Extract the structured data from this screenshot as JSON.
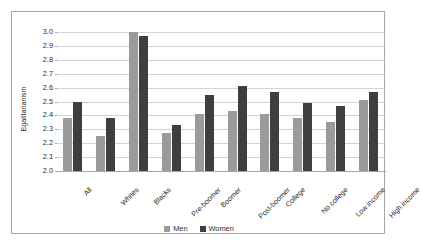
{
  "chart_data": {
    "type": "bar",
    "title": "",
    "xlabel": "",
    "ylabel": "Egalitarianism",
    "ylim": [
      2.0,
      3.0
    ],
    "ytick_step": 0.1,
    "yticks": [
      "3.0",
      "2.9",
      "2.8",
      "2.7",
      "2.6",
      "2.5",
      "2.4",
      "2.3",
      "2.2",
      "2.1",
      "2.0"
    ],
    "grid": true,
    "legend_position": "bottom-center",
    "categories": [
      "All",
      "Whites",
      "Blacks",
      "Pre-boomer",
      "Boomer",
      "Post-boomer",
      "College",
      "No college",
      "Low income",
      "High income"
    ],
    "series": [
      {
        "name": "Men",
        "color": "#9b9b9b",
        "values": [
          2.38,
          2.25,
          3.0,
          2.27,
          2.41,
          2.43,
          2.41,
          2.38,
          2.35,
          2.51
        ]
      },
      {
        "name": "Women",
        "color": "#3f3f3f",
        "values": [
          2.5,
          2.38,
          2.97,
          2.33,
          2.55,
          2.61,
          2.57,
          2.49,
          2.47,
          2.57
        ]
      }
    ]
  },
  "legend": {
    "entries": [
      {
        "label": "Men",
        "color": "#9b9b9b"
      },
      {
        "label": "Women",
        "color": "#3f3f3f"
      }
    ]
  },
  "colors": {
    "men": "#9b9b9b",
    "women": "#3f3f3f",
    "gridline": "#d3d3d3",
    "axis": "#a6a6a6",
    "frame": "#a6a6a6",
    "background": "#ffffff",
    "text": "#2b2b2b"
  }
}
